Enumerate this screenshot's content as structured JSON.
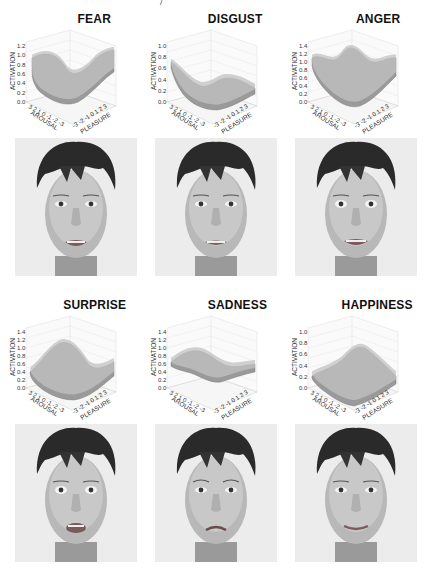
{
  "figure": {
    "top_fragment": "/",
    "panels": [
      {
        "emotion": "FEAR",
        "z_ticks": [
          "0.0",
          "0.2",
          "0.4",
          "0.6",
          "0.8",
          "1.0",
          "1.2"
        ]
      },
      {
        "emotion": "DISGUST",
        "z_ticks": [
          "0.0",
          "0.2",
          "0.4",
          "0.6",
          "0.8",
          "1.0"
        ]
      },
      {
        "emotion": "ANGER",
        "z_ticks": [
          "0.0",
          "0.2",
          "0.4",
          "0.6",
          "0.8",
          "1.0",
          "1.2",
          "1.4"
        ]
      },
      {
        "emotion": "SURPRISE",
        "z_ticks": [
          "0.0",
          "0.2",
          "0.4",
          "0.6",
          "0.8",
          "1.0",
          "1.2",
          "1.4"
        ]
      },
      {
        "emotion": "SADNESS",
        "z_ticks": [
          "0.0",
          "0.2",
          "0.4",
          "0.6",
          "0.8",
          "1.0",
          "1.2",
          "1.4"
        ]
      },
      {
        "emotion": "HAPPINESS",
        "z_ticks": [
          "0.0",
          "0.2",
          "0.4",
          "0.6",
          "0.8",
          "1.0"
        ]
      }
    ],
    "axes": {
      "z_label": "ACTIVATION",
      "x_label": "AROUSAL",
      "y_label": "PLEASURE",
      "arousal_ticks": [
        "3",
        "2",
        "1",
        "0",
        "-1",
        "-2",
        "-3"
      ],
      "pleasure_ticks": [
        "-3",
        "-2",
        "-1",
        "0",
        "1",
        "2",
        "3"
      ]
    }
  },
  "chart_data": [
    {
      "type": "surface3d",
      "title": "FEAR",
      "xlabel": "AROUSAL",
      "ylabel": "PLEASURE",
      "zlabel": "ACTIVATION",
      "x_range": [
        -3,
        3
      ],
      "y_range": [
        -3,
        3
      ],
      "zlim": [
        0.0,
        1.2
      ],
      "z_ticks": [
        0.0,
        0.2,
        0.4,
        0.6,
        0.8,
        1.0,
        1.2
      ],
      "description": "High activation (~1.1-1.2) at high arousal / high pleasure edges, valley (~0.4) near center-low"
    },
    {
      "type": "surface3d",
      "title": "DISGUST",
      "xlabel": "AROUSAL",
      "ylabel": "PLEASURE",
      "zlabel": "ACTIVATION",
      "x_range": [
        -3,
        3
      ],
      "y_range": [
        -3,
        3
      ],
      "zlim": [
        0.0,
        1.0
      ],
      "z_ticks": [
        0.0,
        0.2,
        0.4,
        0.6,
        0.8,
        1.0
      ],
      "description": "Peak ~0.9 at high arousal corner, falling to ~0.3 at low arousal"
    },
    {
      "type": "surface3d",
      "title": "ANGER",
      "xlabel": "AROUSAL",
      "ylabel": "PLEASURE",
      "zlabel": "ACTIVATION",
      "x_range": [
        -3,
        3
      ],
      "y_range": [
        -3,
        3
      ],
      "zlim": [
        0.0,
        1.4
      ],
      "z_ticks": [
        0.0,
        0.2,
        0.4,
        0.6,
        0.8,
        1.0,
        1.2,
        1.4
      ],
      "description": "Ridges ~1.3-1.4 along high arousal and back edges, dip ~0.5 toward front"
    },
    {
      "type": "surface3d",
      "title": "SURPRISE",
      "xlabel": "AROUSAL",
      "ylabel": "PLEASURE",
      "zlabel": "ACTIVATION",
      "x_range": [
        -3,
        3
      ],
      "y_range": [
        -3,
        3
      ],
      "zlim": [
        0.0,
        1.4
      ],
      "z_ticks": [
        0.0,
        0.2,
        0.4,
        0.6,
        0.8,
        1.0,
        1.2,
        1.4
      ],
      "description": "Peak ~1.2 at high arousal / mid pleasure, low ~0.2 at front corner"
    },
    {
      "type": "surface3d",
      "title": "SADNESS",
      "xlabel": "AROUSAL",
      "ylabel": "PLEASURE",
      "zlabel": "ACTIVATION",
      "x_range": [
        -3,
        3
      ],
      "y_range": [
        -3,
        3
      ],
      "zlim": [
        0.0,
        1.4
      ],
      "z_ticks": [
        0.0,
        0.2,
        0.4,
        0.6,
        0.8,
        1.0,
        1.2,
        1.4
      ],
      "description": "Wavy surface ~0.6-1.0, fold near center"
    },
    {
      "type": "surface3d",
      "title": "HAPPINESS",
      "xlabel": "AROUSAL",
      "ylabel": "PLEASURE",
      "zlabel": "ACTIVATION",
      "x_range": [
        -3,
        3
      ],
      "y_range": [
        -3,
        3
      ],
      "zlim": [
        0.0,
        1.0
      ],
      "z_ticks": [
        0.0,
        0.2,
        0.4,
        0.6,
        0.8,
        1.0
      ],
      "description": "Peak ~0.8 at high pleasure back corner, low ~0.1 at front"
    }
  ]
}
